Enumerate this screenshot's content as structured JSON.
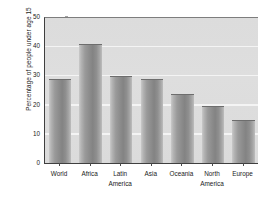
{
  "chart_data": {
    "type": "bar",
    "title": "",
    "xlabel": "",
    "ylabel": "Percentage of people under age 15",
    "categories": [
      "World",
      "Africa",
      "Latin America",
      "Asia",
      "Oceania",
      "North America",
      "Europe"
    ],
    "category_lines": [
      [
        "World"
      ],
      [
        "Africa"
      ],
      [
        "Latin",
        "America"
      ],
      [
        "Asia"
      ],
      [
        "Oceania"
      ],
      [
        "North",
        "America"
      ],
      [
        "Europe"
      ]
    ],
    "values": [
      29,
      41,
      30,
      29,
      24,
      20,
      15
    ],
    "ylim": [
      0,
      50
    ],
    "yticks": [
      0,
      10,
      20,
      30,
      40,
      50
    ],
    "ytick_labels": [
      "0",
      "10",
      "20",
      "30",
      "40",
      "50"
    ],
    "grid": "horizontal",
    "legend": "none",
    "bar_color": "#8d8d8d",
    "plot_background": "#dcdcdc",
    "gridline_color": "#f4f4f4",
    "axis_color": "#3f3f3f",
    "note": "rightmost Europe bar is clipped by the image edge"
  }
}
